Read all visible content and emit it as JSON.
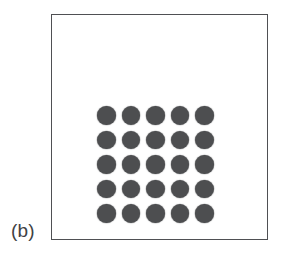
{
  "figure": {
    "panel_label": "(b)",
    "frame": {
      "stroke_color": "#4f5053",
      "fill_color": "#ffffff",
      "stroke_width_px": 1.4
    },
    "background_color": "#ffffff",
    "label_color": "#404144"
  },
  "chart_data": {
    "type": "scatter",
    "title": "",
    "subtitle": "",
    "xlabel": "",
    "ylabel": "",
    "annotations": [
      "(b)"
    ],
    "legend_entries": [],
    "legend_position": "none",
    "grid": false,
    "axis_visible": false,
    "xlim": [
      0,
      1
    ],
    "ylim": [
      0,
      1
    ],
    "marker": {
      "shape": "circle",
      "fill_color": "#4d4e50",
      "edge_color": "#4d4e50",
      "diameter_px": 18.2
    },
    "lattice": {
      "rows": 5,
      "columns": 5,
      "count": 25,
      "pitch_px": 23.6,
      "row_labels": [
        "1",
        "2",
        "3",
        "4",
        "5"
      ],
      "column_labels": [
        "1",
        "2",
        "3",
        "4",
        "5"
      ]
    },
    "points": [
      {
        "row": 1,
        "col": 1,
        "x": 0,
        "y": 4,
        "filled": true
      },
      {
        "row": 1,
        "col": 2,
        "x": 1,
        "y": 4,
        "filled": true
      },
      {
        "row": 1,
        "col": 3,
        "x": 2,
        "y": 4,
        "filled": true
      },
      {
        "row": 1,
        "col": 4,
        "x": 3,
        "y": 4,
        "filled": true
      },
      {
        "row": 1,
        "col": 5,
        "x": 4,
        "y": 4,
        "filled": true
      },
      {
        "row": 2,
        "col": 1,
        "x": 0,
        "y": 3,
        "filled": true
      },
      {
        "row": 2,
        "col": 2,
        "x": 1,
        "y": 3,
        "filled": true
      },
      {
        "row": 2,
        "col": 3,
        "x": 2,
        "y": 3,
        "filled": true
      },
      {
        "row": 2,
        "col": 4,
        "x": 3,
        "y": 3,
        "filled": true
      },
      {
        "row": 2,
        "col": 5,
        "x": 4,
        "y": 3,
        "filled": true
      },
      {
        "row": 3,
        "col": 1,
        "x": 0,
        "y": 2,
        "filled": true
      },
      {
        "row": 3,
        "col": 2,
        "x": 1,
        "y": 2,
        "filled": true
      },
      {
        "row": 3,
        "col": 3,
        "x": 2,
        "y": 2,
        "filled": true
      },
      {
        "row": 3,
        "col": 4,
        "x": 3,
        "y": 2,
        "filled": true
      },
      {
        "row": 3,
        "col": 5,
        "x": 4,
        "y": 2,
        "filled": true
      },
      {
        "row": 4,
        "col": 1,
        "x": 0,
        "y": 1,
        "filled": true
      },
      {
        "row": 4,
        "col": 2,
        "x": 1,
        "y": 1,
        "filled": true
      },
      {
        "row": 4,
        "col": 3,
        "x": 2,
        "y": 1,
        "filled": true
      },
      {
        "row": 4,
        "col": 4,
        "x": 3,
        "y": 1,
        "filled": true
      },
      {
        "row": 4,
        "col": 5,
        "x": 4,
        "y": 1,
        "filled": true
      },
      {
        "row": 5,
        "col": 1,
        "x": 0,
        "y": 0,
        "filled": true
      },
      {
        "row": 5,
        "col": 2,
        "x": 1,
        "y": 0,
        "filled": true
      },
      {
        "row": 5,
        "col": 3,
        "x": 2,
        "y": 0,
        "filled": true
      },
      {
        "row": 5,
        "col": 4,
        "x": 3,
        "y": 0,
        "filled": true
      },
      {
        "row": 5,
        "col": 5,
        "x": 4,
        "y": 0,
        "filled": true
      }
    ]
  }
}
